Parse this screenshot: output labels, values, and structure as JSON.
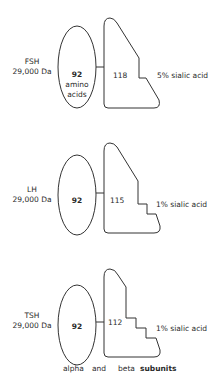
{
  "hormones": [
    {
      "name": "FSH",
      "mass": "29,000 Da",
      "alpha": {
        "count": "92",
        "note_line1": "amino",
        "note_line2": "acids"
      },
      "beta": {
        "count": "118"
      },
      "sialic": "5% sialic acid"
    },
    {
      "name": "LH",
      "mass": "29,000 Da",
      "alpha": {
        "count": "92"
      },
      "beta": {
        "count": "115"
      },
      "sialic": "1% sialic acid"
    },
    {
      "name": "TSH",
      "mass": "29,000 Da",
      "alpha": {
        "count": "92"
      },
      "beta": {
        "count": "112"
      },
      "sialic": "1% sialic acid"
    }
  ],
  "caption": {
    "alpha": "alpha",
    "and": "and",
    "beta": "beta",
    "subunits": "subunits"
  },
  "colors": {
    "stroke": "#333333",
    "background": "#ffffff"
  }
}
